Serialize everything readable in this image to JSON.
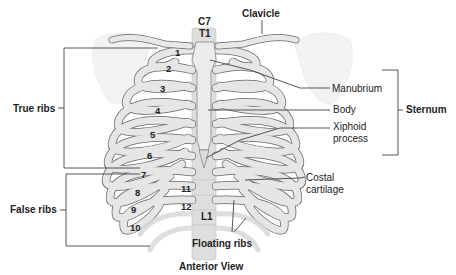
{
  "diagram": {
    "title": "Anterior View",
    "vertebrae": {
      "c7": "C7",
      "t1": "T1",
      "l1": "L1"
    },
    "rib_numbers": [
      "1",
      "2",
      "3",
      "4",
      "5",
      "6",
      "7",
      "8",
      "9",
      "10",
      "11",
      "12"
    ],
    "labels": {
      "clavicle": "Clavicle",
      "true_ribs": "True ribs",
      "false_ribs": "False ribs",
      "floating_ribs": "Floating ribs",
      "manubrium": "Manubrium",
      "body": "Body",
      "xiphoid_line1": "Xiphoid",
      "xiphoid_line2": "process",
      "sternum": "Sternum",
      "costal_line1": "Costal",
      "costal_line2": "cartilage"
    },
    "colors": {
      "bone": "#e4e4e4",
      "bone_outline": "#555555",
      "cartilage": "#c9c9c9",
      "shadow": "#b5b5b5",
      "leader_line": "#444444",
      "text": "#222222"
    }
  }
}
